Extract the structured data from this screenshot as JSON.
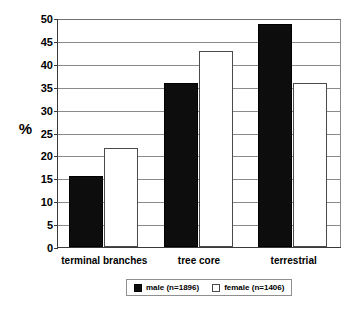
{
  "chart_data": {
    "type": "bar",
    "title": "",
    "subtitle": "",
    "xlabel": "",
    "ylabel": "%",
    "categories": [
      "terminal branches",
      "tree core",
      "terrestrial"
    ],
    "series": [
      {
        "name": "male (n=1896)",
        "color": "#0d0d0d",
        "values": [
          15.4,
          35.9,
          48.6
        ]
      },
      {
        "name": "female (n=1406)",
        "color": "#ffffff",
        "values": [
          21.6,
          42.7,
          35.9
        ]
      }
    ],
    "ylim": [
      0,
      50
    ],
    "ytick_step": 5,
    "yticks": [
      "50",
      "45",
      "40",
      "35",
      "30",
      "25",
      "20",
      "15",
      "10",
      "5",
      "0"
    ],
    "grid": true,
    "grid_axis": "y",
    "legend_position": "bottom"
  },
  "legend": {
    "entries": [
      {
        "label": "male (n=1896)",
        "swatch": "filled-black-square"
      },
      {
        "label": "female (n=1406)",
        "swatch": "open-white-square"
      }
    ]
  }
}
